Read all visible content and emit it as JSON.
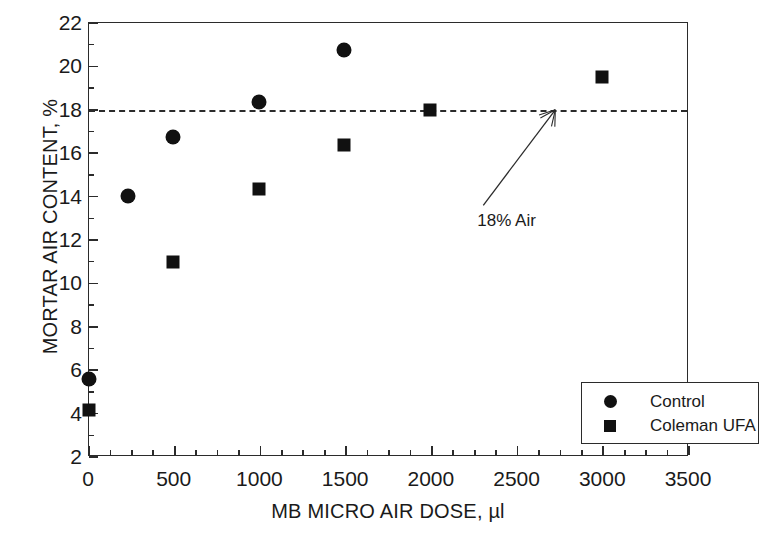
{
  "chart_data": {
    "type": "scatter",
    "title": "",
    "xlabel": "MB MICRO AIR DOSE, µl",
    "ylabel": "MORTAR AIR CONTENT, %",
    "xlim": [
      0,
      3500
    ],
    "ylim": [
      2,
      22
    ],
    "xticks": [
      0,
      500,
      1000,
      1500,
      2000,
      2500,
      3000,
      3500
    ],
    "yticks": [
      2,
      4,
      6,
      8,
      10,
      12,
      14,
      16,
      18,
      20,
      22
    ],
    "x_minor_interval": 125,
    "y_minor_interval": 1,
    "grid": false,
    "legend_position": "lower-right",
    "series": [
      {
        "name": "Control",
        "marker": "circle",
        "color": "#111111",
        "points": [
          {
            "x": 0,
            "y": 5.6
          },
          {
            "x": 230,
            "y": 14.05
          },
          {
            "x": 490,
            "y": 16.75
          },
          {
            "x": 990,
            "y": 18.35
          },
          {
            "x": 1490,
            "y": 20.75
          }
        ]
      },
      {
        "name": "Coleman UFA",
        "marker": "square",
        "color": "#111111",
        "points": [
          {
            "x": 0,
            "y": 4.15
          },
          {
            "x": 490,
            "y": 11.0
          },
          {
            "x": 990,
            "y": 14.35
          },
          {
            "x": 1490,
            "y": 16.4
          },
          {
            "x": 1990,
            "y": 18.0
          },
          {
            "x": 2990,
            "y": 19.5
          }
        ]
      }
    ],
    "reference_lines": [
      {
        "name": "18% Air",
        "orientation": "horizontal",
        "y": 18.0,
        "style": "dashed",
        "color": "#2b2b2b"
      }
    ],
    "annotations": [
      {
        "text": "18% Air",
        "target_x": 2720,
        "target_y": 18.0,
        "label_x": 2300,
        "label_y": 13.6,
        "arrow": true
      }
    ]
  },
  "legend": {
    "entries": [
      {
        "label": "Control",
        "marker": "circle"
      },
      {
        "label": "Coleman UFA",
        "marker": "square"
      }
    ]
  }
}
